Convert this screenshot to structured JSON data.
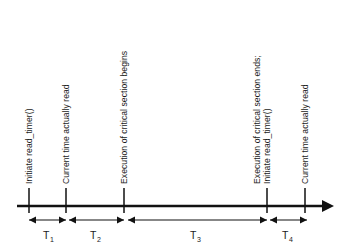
{
  "diagram": {
    "axis": {
      "start_x": 17,
      "end_x": 331,
      "y": 206,
      "arrow": "right-arrow"
    },
    "events": [
      {
        "id": "initiate-read-timer-first",
        "x": 29,
        "lines": [
          "Initiate read_timer()"
        ]
      },
      {
        "id": "current-time-read-first",
        "x": 66,
        "lines": [
          "Current time actually read"
        ]
      },
      {
        "id": "critical-section-begins",
        "x": 124,
        "lines": [
          "Execution of critical section begins"
        ]
      },
      {
        "id": "critical-section-ends-and-reinitiate",
        "x": 267,
        "lines": [
          "Execution of critical section ends;",
          "Initiate read_timer()"
        ]
      },
      {
        "id": "current-time-read-second",
        "x": 305,
        "lines": [
          "Current time actually read"
        ]
      }
    ],
    "intervals": [
      {
        "id": "t1",
        "label": "T",
        "subscript": "1",
        "from_x": 29,
        "to_x": 66,
        "center_x": 47.5
      },
      {
        "id": "t2",
        "label": "T",
        "subscript": "2",
        "from_x": 66,
        "to_x": 124,
        "center_x": 95
      },
      {
        "id": "t3",
        "label": "T",
        "subscript": "3",
        "from_x": 124,
        "to_x": 267,
        "center_x": 195
      },
      {
        "id": "t4",
        "label": "T",
        "subscript": "4",
        "from_x": 267,
        "to_x": 305,
        "center_x": 286
      }
    ],
    "colors": {
      "ink": "#111111",
      "text": "#1b1b1b",
      "background": "#ffffff"
    }
  }
}
